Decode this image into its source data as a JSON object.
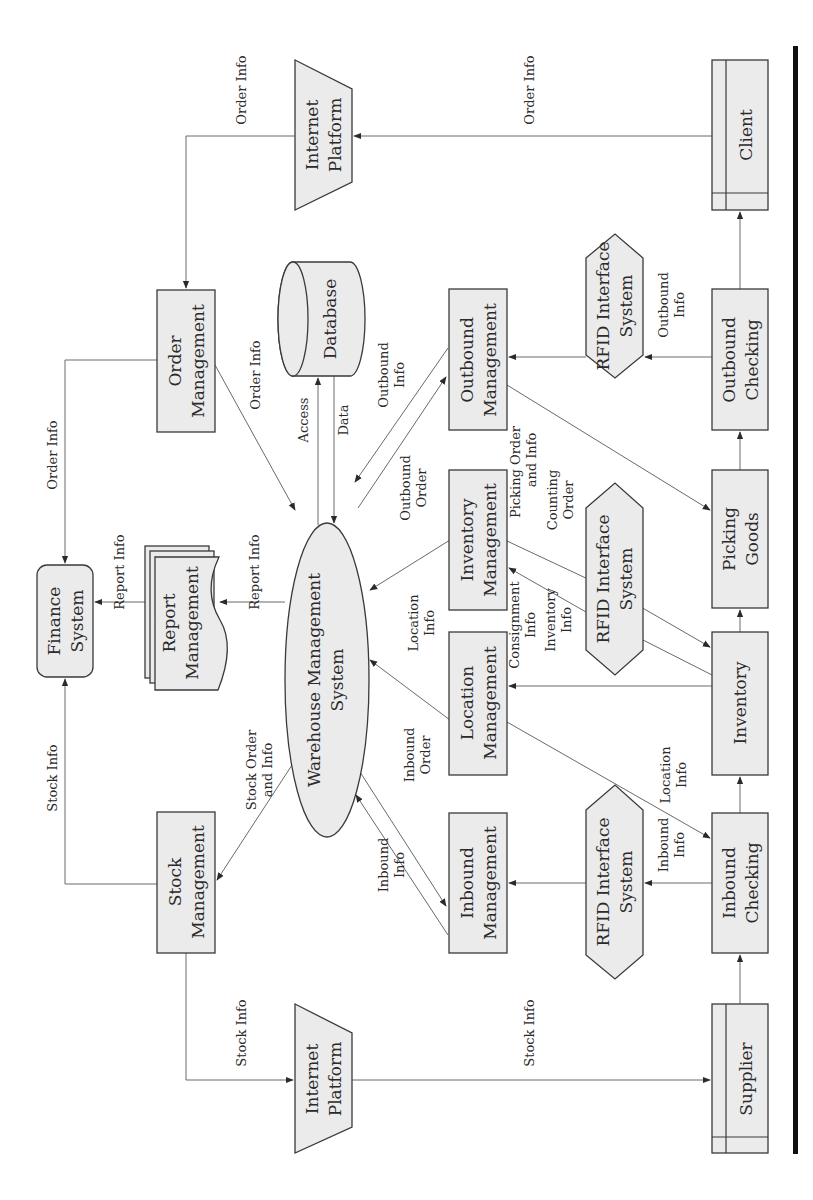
{
  "diagram": {
    "orientation": "rotated-90-ccw",
    "colors": {
      "node_fill": "#ebebeb",
      "stroke": "#3a3a3a",
      "edge": "#6a6a6a",
      "bar": "#111111"
    },
    "nodes": {
      "internet_platform_top": {
        "line1": "Internet",
        "line2": "Platform",
        "shape": "trapezoid"
      },
      "client": {
        "line1": "Client",
        "shape": "external-entity"
      },
      "order_management": {
        "line1": "Order",
        "line2": "Management",
        "shape": "rect"
      },
      "database": {
        "line1": "Database",
        "shape": "cylinder"
      },
      "outbound_management": {
        "line1": "Outbound",
        "line2": "Management",
        "shape": "rect"
      },
      "rfid_top": {
        "line1": "RFID Interface",
        "line2": "System",
        "shape": "hexagon"
      },
      "outbound_checking": {
        "line1": "Outbound",
        "line2": "Checking",
        "shape": "rect"
      },
      "finance_system": {
        "line1": "Finance",
        "line2": "System",
        "shape": "rounded-rect"
      },
      "report_management": {
        "line1": "Report",
        "line2": "Management",
        "shape": "multi-document"
      },
      "wms": {
        "line1": "Warehouse Management",
        "line2": "System",
        "shape": "ellipse"
      },
      "inventory_management": {
        "line1": "Inventory",
        "line2": "Management",
        "shape": "rect"
      },
      "location_management": {
        "line1": "Location",
        "line2": "Management",
        "shape": "rect"
      },
      "rfid_mid": {
        "line1": "RFID Interface",
        "line2": "System",
        "shape": "hexagon"
      },
      "picking_goods": {
        "line1": "Picking",
        "line2": "Goods",
        "shape": "rect"
      },
      "inventory": {
        "line1": "Inventory",
        "shape": "rect"
      },
      "stock_management": {
        "line1": "Stock",
        "line2": "Management",
        "shape": "rect"
      },
      "inbound_management": {
        "line1": "Inbound",
        "line2": "Management",
        "shape": "rect"
      },
      "rfid_bottom": {
        "line1": "RFID Interface",
        "line2": "System",
        "shape": "hexagon"
      },
      "inbound_checking": {
        "line1": "Inbound",
        "line2": "Checking",
        "shape": "rect"
      },
      "internet_platform_bottom": {
        "line1": "Internet",
        "line2": "Platform",
        "shape": "trapezoid"
      },
      "supplier": {
        "line1": "Supplier",
        "shape": "external-entity"
      }
    },
    "edge_labels": {
      "client_to_platform": "Order Info",
      "platform_to_order": "Order Info",
      "order_to_finance": "Order Info",
      "order_to_wms": "Order Info",
      "wms_to_db": "Access",
      "db_to_wms": "Data",
      "outbound_info": {
        "line1": "Outbound",
        "line2": "Info"
      },
      "outbound_order": {
        "line1": "Outbound",
        "line2": "Order"
      },
      "checking_to_rfid_out": {
        "line1": "Outbound",
        "line2": "Info"
      },
      "picking_order": {
        "line1": "Picking Order",
        "line2": "and Info"
      },
      "counting_order": {
        "line1": "Counting",
        "line2": "Order"
      },
      "report_to_finance": "Report Info",
      "wms_to_report": "Report Info",
      "location_info_top": {
        "line1": "Location",
        "line2": "Info"
      },
      "consignment_info": {
        "line1": "Consignment",
        "line2": "Info"
      },
      "inventory_info": {
        "line1": "Inventory",
        "line2": "Info"
      },
      "location_info_bottom": {
        "line1": "Location",
        "line2": "Info"
      },
      "stock_order": {
        "line1": "Stock Order",
        "line2": "and Info"
      },
      "inbound_order": {
        "line1": "Inbound",
        "line2": "Order"
      },
      "inbound_info_wms": {
        "line1": "Inbound",
        "line2": "Info"
      },
      "checking_to_rfid_in": {
        "line1": "Inbound",
        "line2": "Info"
      },
      "stock_to_finance": "Stock Info",
      "stock_to_platform": "Stock Info",
      "platform_to_supplier": "Stock Info"
    }
  }
}
